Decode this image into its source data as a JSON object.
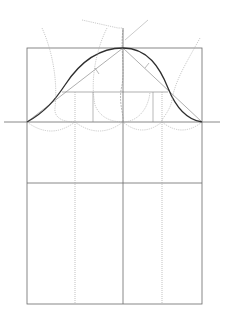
{
  "diagram": {
    "kind": "sleeve-cap pattern draft",
    "colors": {
      "background": "#ffffff",
      "frame_line": "#6a6a6a",
      "construction_line": "#8c8c8c",
      "dotted_line": "#a8a8a8",
      "cap_curve": "#2e2e2e"
    },
    "frame": {
      "x1": 27,
      "y1": 48,
      "x2": 202,
      "y2": 304
    },
    "biceps_line": {
      "y": 122,
      "x1": 4,
      "x2": 220
    },
    "elbow_line": {
      "y": 183,
      "x1": 27,
      "x2": 202
    },
    "cap_mid_line": {
      "y": 92,
      "x1": 60,
      "x2": 170
    },
    "center_line_x": 123,
    "quarter_lines_x": [
      75,
      162
    ],
    "cap_apex": {
      "x": 123,
      "y": 48
    }
  }
}
